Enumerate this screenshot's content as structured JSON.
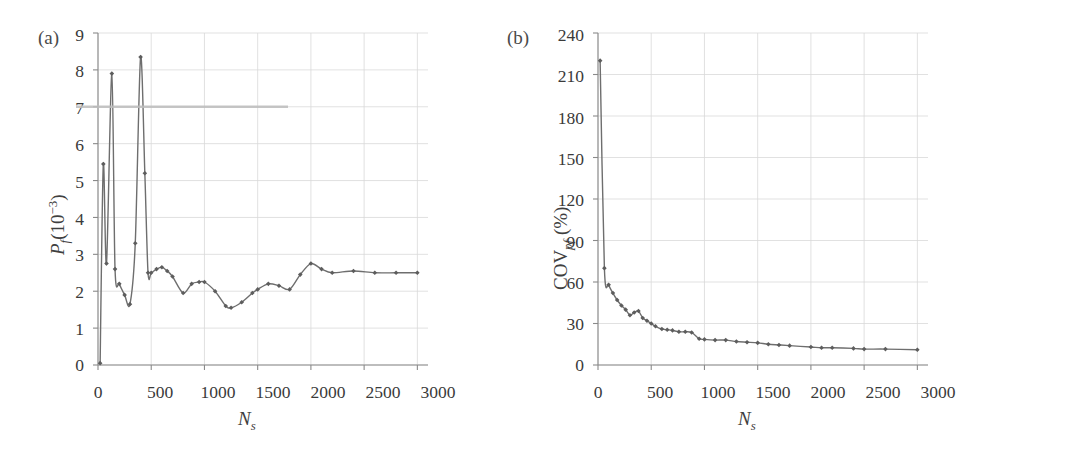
{
  "figure": {
    "panels": [
      {
        "tag": "(a)",
        "ylabel_main": "P",
        "ylabel_sub": "f",
        "ylabel_rest": "(10",
        "ylabel_sup": "−3",
        "ylabel_close": ")",
        "xlabel_main": "N",
        "xlabel_sub": "s"
      },
      {
        "tag": "(b)",
        "ylabel_main": "COV",
        "ylabel_sub": "pf",
        "ylabel_rest": " (%)",
        "xlabel_main": "N",
        "xlabel_sub": "s"
      }
    ],
    "line_color": "#6e6e6e",
    "marker_color": "#5d5d5d",
    "grid_color": "#d9d9d9",
    "axis_color": "#8a8a8a",
    "artifact_color": "#bdbdbd"
  },
  "chart_data": [
    {
      "type": "line",
      "title": "(a)",
      "xlabel": "N_s",
      "ylabel": "P_f (10^-3)",
      "xlim": [
        0,
        3100
      ],
      "ylim": [
        0,
        9
      ],
      "xticks": [
        0,
        500,
        1000,
        1500,
        2000,
        2500,
        3000
      ],
      "yticks": [
        0,
        1,
        2,
        3,
        4,
        5,
        6,
        7,
        8,
        9
      ],
      "grid": true,
      "legend": "none",
      "marker": "diamond",
      "series": [
        {
          "name": "P_f",
          "x": [
            20,
            50,
            80,
            130,
            160,
            200,
            250,
            300,
            350,
            400,
            440,
            470,
            500,
            550,
            600,
            650,
            700,
            800,
            880,
            950,
            1000,
            1100,
            1200,
            1250,
            1350,
            1450,
            1500,
            1600,
            1700,
            1800,
            1900,
            2000,
            2100,
            2200,
            2400,
            2600,
            2800,
            3000
          ],
          "y": [
            0.05,
            5.45,
            2.75,
            7.9,
            2.6,
            2.2,
            1.9,
            1.65,
            3.3,
            8.35,
            5.2,
            2.5,
            2.5,
            2.6,
            2.65,
            2.55,
            2.4,
            1.95,
            2.2,
            2.25,
            2.25,
            2.0,
            1.6,
            1.55,
            1.7,
            1.95,
            2.05,
            2.2,
            2.15,
            2.05,
            2.45,
            2.75,
            2.6,
            2.5,
            2.55,
            2.5,
            2.5,
            2.5
          ]
        }
      ]
    },
    {
      "type": "line",
      "title": "(b)",
      "xlabel": "N_s",
      "ylabel": "COV_pf (%)",
      "xlim": [
        0,
        3100
      ],
      "ylim": [
        0,
        240
      ],
      "xticks": [
        0,
        500,
        1000,
        1500,
        2000,
        2500,
        3000
      ],
      "yticks": [
        0,
        30,
        60,
        90,
        120,
        150,
        180,
        210,
        240
      ],
      "grid": true,
      "legend": "none",
      "marker": "diamond",
      "series": [
        {
          "name": "COV_pf",
          "x": [
            20,
            60,
            100,
            140,
            180,
            220,
            260,
            300,
            340,
            380,
            420,
            460,
            500,
            540,
            600,
            650,
            700,
            760,
            820,
            880,
            950,
            1000,
            1100,
            1200,
            1300,
            1400,
            1500,
            1600,
            1700,
            1800,
            2000,
            2100,
            2200,
            2400,
            2500,
            2700,
            3000
          ],
          "y": [
            220,
            70,
            58,
            52,
            47,
            43,
            40,
            36,
            38,
            39,
            34,
            32,
            30,
            28,
            26,
            25.5,
            25,
            24,
            24,
            23.5,
            19,
            18.5,
            18,
            18,
            17,
            16.5,
            16,
            15,
            14.5,
            14,
            13,
            12.5,
            12.5,
            12,
            11.5,
            11.5,
            11
          ]
        }
      ]
    }
  ]
}
